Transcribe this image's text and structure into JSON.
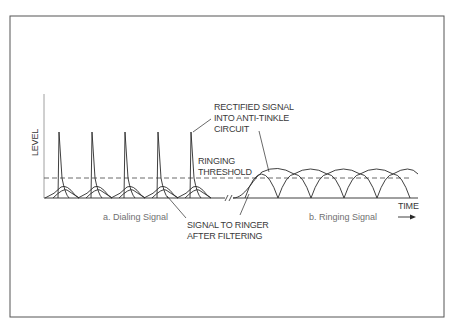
{
  "figure": {
    "frame": {
      "x": 10,
      "y": 16,
      "w": 434,
      "h": 301
    },
    "colors": {
      "line": "#2a2a2a",
      "frame": "#555555",
      "text": "#3a3a3a",
      "caption": "#707070",
      "background": "#ffffff"
    },
    "axis": {
      "y_label": "LEVEL",
      "x_label": "TIME",
      "origin_x": 44,
      "baseline_y": 198,
      "top_y": 94,
      "end_x": 418
    },
    "threshold": {
      "label_line1": "RINGING",
      "label_line2": "THRESHOLD",
      "y": 178
    },
    "annotations": {
      "rectified": {
        "line1": "RECTIFIED SIGNAL",
        "line2": "INTO ANTI-TINKLE",
        "line3": "CIRCUIT"
      },
      "filtered": {
        "line1": "SIGNAL TO RINGER",
        "line2": "AFTER FILTERING"
      }
    },
    "captions": {
      "dialing": "a. Dialing Signal",
      "ringing": "b. Ringing Signal"
    },
    "dialing_spikes_x": [
      59,
      92,
      125,
      158,
      191
    ],
    "spike_peak_y": 132,
    "ringing_zeros_x": [
      245,
      278,
      311,
      344,
      377,
      410
    ],
    "break_symbol": "//"
  }
}
